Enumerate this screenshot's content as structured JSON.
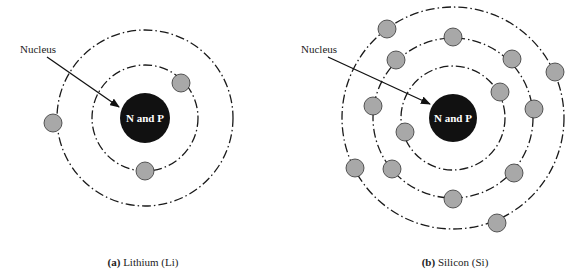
{
  "figure": {
    "background": "#ffffff",
    "orbit_color": "#1a1a1a",
    "electron_fill": "#a8a8a8",
    "electron_stroke": "#333333",
    "nucleus_fill": "#111111",
    "nucleus_text_color": "#ffffff"
  },
  "panels": [
    {
      "id": "a",
      "caption_letter": "(a)",
      "caption_text": " Lithium (Li)",
      "pointer_label": "Nucleus",
      "nucleus_label": "N and P",
      "nucleus": {
        "cx": 145,
        "cy": 118,
        "r": 25
      },
      "orbits": [
        53,
        88
      ],
      "electron_count": 3,
      "electrons": [
        {
          "orbit": 1,
          "cx": 181,
          "cy": 83
        },
        {
          "orbit": 1,
          "cx": 145,
          "cy": 171
        },
        {
          "orbit": 2,
          "cx": 53,
          "cy": 123
        }
      ],
      "arrow": {
        "x1": 47,
        "y1": 57,
        "x2": 119,
        "y2": 107
      },
      "label_pos": {
        "x": 20,
        "y": 43
      },
      "caption_pos": {
        "x": 143,
        "y": 256
      }
    },
    {
      "id": "b",
      "caption_letter": "(b)",
      "caption_text": " Silicon (Si)",
      "pointer_label": "Nucleus",
      "nucleus_label": "N and P",
      "nucleus": {
        "cx": 453,
        "cy": 118,
        "r": 24
      },
      "orbits": [
        52,
        80,
        111
      ],
      "electron_count": 14,
      "electrons": [
        {
          "orbit": 1,
          "cx": 500,
          "cy": 92
        },
        {
          "orbit": 1,
          "cx": 405,
          "cy": 132
        },
        {
          "orbit": 2,
          "cx": 453,
          "cy": 37
        },
        {
          "orbit": 2,
          "cx": 512,
          "cy": 59
        },
        {
          "orbit": 2,
          "cx": 396,
          "cy": 60
        },
        {
          "orbit": 2,
          "cx": 373,
          "cy": 106
        },
        {
          "orbit": 2,
          "cx": 534,
          "cy": 109
        },
        {
          "orbit": 2,
          "cx": 392,
          "cy": 169
        },
        {
          "orbit": 2,
          "cx": 514,
          "cy": 173
        },
        {
          "orbit": 2,
          "cx": 453,
          "cy": 199
        },
        {
          "orbit": 3,
          "cx": 387,
          "cy": 29
        },
        {
          "orbit": 3,
          "cx": 555,
          "cy": 72
        },
        {
          "orbit": 3,
          "cx": 355,
          "cy": 168
        },
        {
          "orbit": 3,
          "cx": 497,
          "cy": 223
        }
      ],
      "arrow": {
        "x1": 328,
        "y1": 57,
        "x2": 430,
        "y2": 104
      },
      "label_pos": {
        "x": 301,
        "y": 43
      },
      "caption_pos": {
        "x": 455,
        "y": 256
      }
    }
  ]
}
